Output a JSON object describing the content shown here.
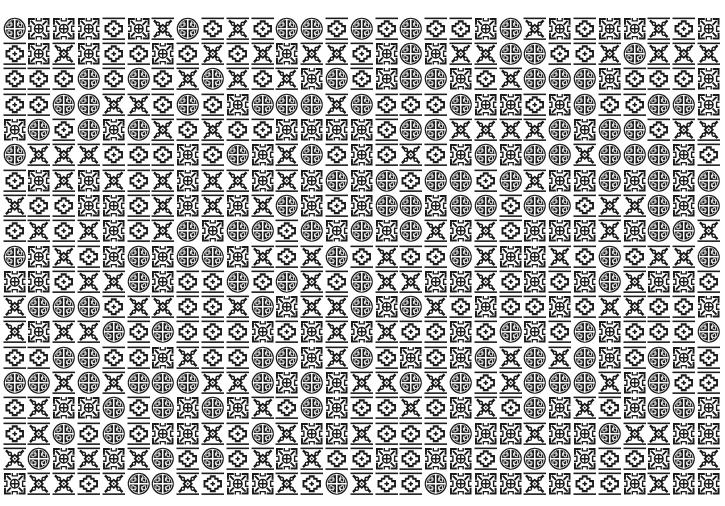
{
  "pattern": {
    "columns": 29,
    "rows": 19,
    "colors": {
      "ink": "#1a1a1a",
      "paper": "#ffffff"
    },
    "tile_types": {
      "C": "circle-fret-medallion",
      "K": "square-knot-fret",
      "D": "stepped-diamond",
      "X": "x-diamond-dots"
    },
    "grid": [
      "CKKKDKXCDXDCCDCDCDDKCXKDKKXDK",
      "DKXKDDKDXDXKXXDKCKXXCCDDXCXXX",
      "DDDCDCDXCXDXKCDKCCKDXCCCKDDDK",
      "DDCCXXDCDKCCCXCDDDCKKDKCDDCCK",
      "KCDCKCXDXDDKKKKDCCXXXXCKCCDXX",
      "CXXXDDDKDCKXCDKDXDKCKCCXCCCKD",
      "DKXKXDXKXXKXKCKCDCCDCXKKCKCKC",
      "XDDKKDXKXKXCKDKCCKCCDCCDXXCKC",
      "DXDXKDXCKCCDCKCKCXKXDKKKXKCCX",
      "CKXDKCKCCKXDXCDXDDCXKKXDCDXXC",
      "KKDXXCKDDCDCXDCXXKKXDKDKCXKKD",
      "XCCCDXXDDXCKXXCKCXDKDDKDXXDDK",
      "XKXXCDCDDDKDKXKXDDKDCKDCKDDDC",
      "DDCCDDKXDDCCKXCDKDKCXCXCKDCKD",
      "CCXCXCCCXXCKCKXXCXCDXCCCXKCDD",
      "DXKKCDCKCKXDCKDDXDKXDCKXDKCCK",
      "DXCDCDKKXDCXKKXDDDCKKXKKCXXKK",
      "XCKXKXCDCDXKXDDKDKKDCCCKDDKCX",
      "KXXDXCCXDKKXDCXDDCKKKXKDDKXKK"
    ]
  }
}
